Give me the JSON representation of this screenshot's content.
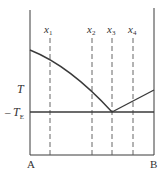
{
  "diagram": {
    "type": "binary eutectic phase diagram",
    "y_axis_label": "T",
    "eutectic_label": "T",
    "eutectic_subscript": "E",
    "eutectic_tick": "–",
    "left_component": "A",
    "right_component": "B",
    "compositions": [
      {
        "name": "x",
        "sub": "1"
      },
      {
        "name": "x",
        "sub": "2"
      },
      {
        "name": "x",
        "sub": "3"
      },
      {
        "name": "x",
        "sub": "4"
      }
    ],
    "colors": {
      "line": "#3a3a3a",
      "dashed": "#555555",
      "text": "#333333"
    }
  }
}
